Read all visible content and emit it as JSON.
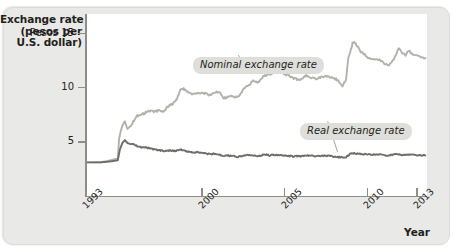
{
  "figure": {
    "y_axis_title_lines": [
      "Exchange rate",
      "(pesos per",
      "U.S. dollar)"
    ],
    "x_axis_title": "Year",
    "background_color": "#e9e9e7",
    "plot_background_color": "#ffffff",
    "axis_color": "#8d8d8a",
    "callout_background": "#dededa"
  },
  "callouts": [
    {
      "name": "nominal",
      "label": "Nominal exchange rate"
    },
    {
      "name": "real",
      "label": "Real exchange rate"
    }
  ],
  "chart_data": {
    "type": "line",
    "title": "",
    "xlabel": "Year",
    "ylabel": "Exchange rate (pesos per U.S. dollar)",
    "ytick_prefix": "Pesos",
    "ylim": [
      0,
      16.8
    ],
    "xlim": [
      1993,
      2013.6
    ],
    "yticks": [
      5,
      10,
      15
    ],
    "ytick_labels": [
      "5",
      "10",
      "Pesos 15"
    ],
    "xticks": [
      1993,
      2000,
      2005,
      2010,
      2013
    ],
    "xtick_labels": [
      "1993",
      "2000",
      "2005",
      "2010",
      "2013"
    ],
    "grid": false,
    "legend": "annotated-callouts",
    "series": [
      {
        "name": "Nominal exchange rate",
        "color": "#b2b2ab",
        "x": [
          1993.0,
          1993.3,
          1993.6,
          1993.9,
          1994.2,
          1994.5,
          1994.75,
          1994.92,
          1995.0,
          1995.1,
          1995.2,
          1995.35,
          1995.5,
          1995.7,
          1995.9,
          1996.1,
          1996.3,
          1996.5,
          1996.7,
          1996.9,
          1997.1,
          1997.3,
          1997.5,
          1997.7,
          1997.9,
          1998.1,
          1998.3,
          1998.5,
          1998.7,
          1998.9,
          1999.1,
          1999.3,
          1999.5,
          1999.7,
          1999.9,
          2000.1,
          2000.3,
          2000.5,
          2000.7,
          2000.9,
          2001.1,
          2001.3,
          2001.5,
          2001.7,
          2001.9,
          2002.1,
          2002.3,
          2002.5,
          2002.7,
          2002.9,
          2003.1,
          2003.3,
          2003.5,
          2003.7,
          2003.9,
          2004.1,
          2004.3,
          2004.5,
          2004.7,
          2004.9,
          2005.1,
          2005.3,
          2005.5,
          2005.7,
          2005.9,
          2006.1,
          2006.3,
          2006.5,
          2006.7,
          2006.9,
          2007.1,
          2007.3,
          2007.5,
          2007.7,
          2007.9,
          2008.1,
          2008.3,
          2008.5,
          2008.7,
          2008.85,
          2009.0,
          2009.1,
          2009.25,
          2009.4,
          2009.6,
          2009.8,
          2010.0,
          2010.2,
          2010.5,
          2010.8,
          2011.0,
          2011.3,
          2011.6,
          2011.9,
          2012.1,
          2012.3,
          2012.5,
          2012.7,
          2012.9,
          2013.2,
          2013.5
        ],
        "y": [
          3.1,
          3.1,
          3.12,
          3.12,
          3.2,
          3.3,
          3.4,
          3.45,
          5.3,
          6.0,
          6.5,
          6.9,
          6.2,
          6.4,
          7.0,
          7.4,
          7.5,
          7.6,
          7.8,
          7.85,
          7.8,
          7.85,
          7.9,
          7.8,
          8.2,
          8.4,
          8.6,
          9.0,
          9.8,
          9.9,
          9.6,
          9.5,
          9.4,
          9.5,
          9.45,
          9.5,
          9.4,
          9.3,
          9.5,
          9.6,
          9.6,
          9.0,
          9.1,
          9.2,
          9.2,
          9.1,
          9.3,
          9.8,
          10.1,
          10.3,
          10.7,
          10.5,
          10.6,
          11.0,
          11.2,
          11.2,
          11.4,
          11.5,
          11.4,
          11.3,
          11.2,
          11.1,
          10.9,
          10.8,
          10.7,
          10.9,
          11.1,
          10.9,
          10.9,
          10.8,
          10.9,
          11.0,
          11.0,
          11.0,
          10.9,
          10.8,
          10.5,
          10.2,
          10.7,
          12.8,
          13.5,
          14.1,
          14.2,
          13.8,
          13.3,
          13.1,
          12.8,
          12.6,
          12.7,
          12.5,
          12.2,
          12.1,
          12.6,
          13.6,
          13.2,
          13.0,
          13.4,
          13.1,
          13.0,
          12.8,
          12.7
        ]
      },
      {
        "name": "Real exchange rate",
        "color": "#6d6d6a",
        "x": [
          1993.0,
          1993.3,
          1993.6,
          1993.9,
          1994.2,
          1994.5,
          1994.75,
          1994.92,
          1995.05,
          1995.2,
          1995.35,
          1995.5,
          1995.7,
          1995.9,
          1996.1,
          1996.3,
          1996.5,
          1996.7,
          1996.9,
          1997.1,
          1997.3,
          1997.5,
          1997.7,
          1997.9,
          1998.1,
          1998.3,
          1998.5,
          1998.7,
          1998.9,
          1999.1,
          1999.3,
          1999.5,
          1999.7,
          1999.9,
          2000.1,
          2000.3,
          2000.5,
          2000.7,
          2000.9,
          2001.1,
          2001.3,
          2001.5,
          2001.7,
          2001.9,
          2002.1,
          2002.3,
          2002.5,
          2002.7,
          2002.9,
          2003.1,
          2003.3,
          2003.5,
          2003.7,
          2003.9,
          2004.1,
          2004.3,
          2004.5,
          2004.7,
          2004.9,
          2005.1,
          2005.3,
          2005.5,
          2005.7,
          2005.9,
          2006.1,
          2006.3,
          2006.5,
          2006.7,
          2006.9,
          2007.1,
          2007.3,
          2007.5,
          2007.7,
          2007.9,
          2008.1,
          2008.3,
          2008.5,
          2008.7,
          2008.85,
          2009.0,
          2009.2,
          2009.4,
          2009.6,
          2009.8,
          2010.0,
          2010.3,
          2010.6,
          2010.9,
          2011.2,
          2011.5,
          2011.8,
          2012.1,
          2012.4,
          2012.7,
          2013.0,
          2013.3,
          2013.5
        ],
        "y": [
          3.1,
          3.1,
          3.1,
          3.1,
          3.15,
          3.2,
          3.25,
          3.3,
          4.3,
          4.9,
          5.2,
          4.9,
          4.8,
          4.75,
          4.6,
          4.5,
          4.5,
          4.45,
          4.4,
          4.3,
          4.25,
          4.2,
          4.15,
          4.2,
          4.2,
          4.15,
          4.2,
          4.3,
          4.2,
          4.1,
          4.05,
          4.0,
          4.05,
          4.0,
          3.95,
          3.9,
          3.85,
          3.9,
          3.85,
          3.8,
          3.7,
          3.75,
          3.7,
          3.7,
          3.6,
          3.65,
          3.7,
          3.75,
          3.75,
          3.75,
          3.7,
          3.7,
          3.8,
          3.8,
          3.75,
          3.8,
          3.8,
          3.75,
          3.75,
          3.7,
          3.7,
          3.65,
          3.7,
          3.65,
          3.7,
          3.75,
          3.7,
          3.7,
          3.65,
          3.7,
          3.7,
          3.7,
          3.7,
          3.65,
          3.6,
          3.6,
          3.55,
          3.6,
          3.75,
          3.95,
          3.95,
          3.9,
          3.9,
          3.85,
          3.85,
          3.8,
          3.85,
          3.8,
          3.75,
          3.8,
          3.85,
          3.8,
          3.8,
          3.8,
          3.75,
          3.75,
          3.75
        ]
      }
    ]
  }
}
